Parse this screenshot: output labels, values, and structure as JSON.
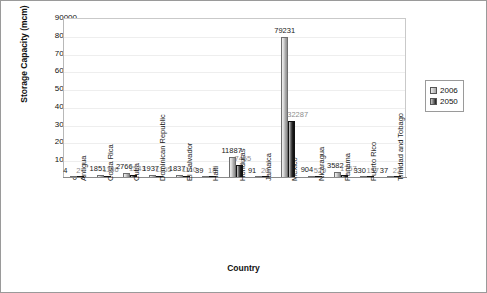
{
  "chart_data": {
    "type": "bar",
    "title": "",
    "xlabel": "Country",
    "ylabel": "Storage Capacity (mcm)",
    "ylim": [
      0,
      90000
    ],
    "ytick_values": [
      90000,
      80000,
      70000,
      60000,
      50000,
      40000,
      30000,
      20000,
      10000,
      0
    ],
    "yticks": [
      "90000",
      "80000",
      "70000",
      "60000",
      "50000",
      "40000",
      "30000",
      "20000",
      "10000",
      "0"
    ],
    "grid": true,
    "legend_position": "right",
    "categories": [
      "Antigua",
      "Costa Rica",
      "Cuba",
      "Dominican Republic",
      "El Salvador",
      "Haiti",
      "Honduras",
      "Jamaica",
      "Mexico",
      "Nicaragua",
      "Panama",
      "Puerto Rico",
      "Trinidad and Tobago"
    ],
    "series": [
      {
        "name": "2006",
        "color": "#a8a8a8",
        "values": [
          4,
          1851,
          2766,
          1937,
          1837,
          39,
          11887,
          91,
          79231,
          904,
          3582,
          330,
          37
        ],
        "labels": [
          "4",
          "1851",
          "2766",
          "1937",
          "1837",
          "39",
          "11887",
          "91",
          "79231",
          "904",
          "3582",
          "330",
          "37"
        ]
      },
      {
        "name": "2050",
        "color": "#1a1a1a",
        "values": [
          2,
          1186,
          1543,
          1165,
          1110,
          18,
          7455,
          20,
          32287,
          529,
          1757,
          157,
          22
        ],
        "labels": [
          "2",
          "1186",
          "1543",
          "1165",
          "1110",
          "18",
          "7455",
          "20",
          "32287",
          "529",
          "1757",
          "157",
          "22"
        ]
      }
    ]
  },
  "legend": {
    "items": [
      {
        "label": "2006"
      },
      {
        "label": "2050"
      }
    ]
  }
}
